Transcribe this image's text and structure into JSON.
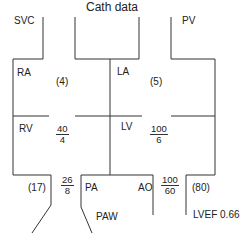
{
  "title": "Cath data",
  "chambers": {
    "svc": "SVC",
    "pv": "PV",
    "ra": "RA",
    "la": "LA",
    "rv": "RV",
    "lv": "LV",
    "pa": "PA",
    "ao": "AO",
    "paw": "PAW"
  },
  "pressures": {
    "ra_mean": "(4)",
    "la_mean": "(5)",
    "rv": {
      "systolic": "40",
      "diastolic": "4"
    },
    "lv": {
      "systolic": "100",
      "diastolic": "6"
    },
    "pa": {
      "systolic": "26",
      "diastolic": "8"
    },
    "pa_mean": "(17)",
    "ao": {
      "systolic": "100",
      "diastolic": "60"
    },
    "ao_mean": "(80)"
  },
  "lvef": "LVEF 0.66",
  "colors": {
    "line": "#333333",
    "text": "#222222",
    "background": "#ffffff"
  }
}
